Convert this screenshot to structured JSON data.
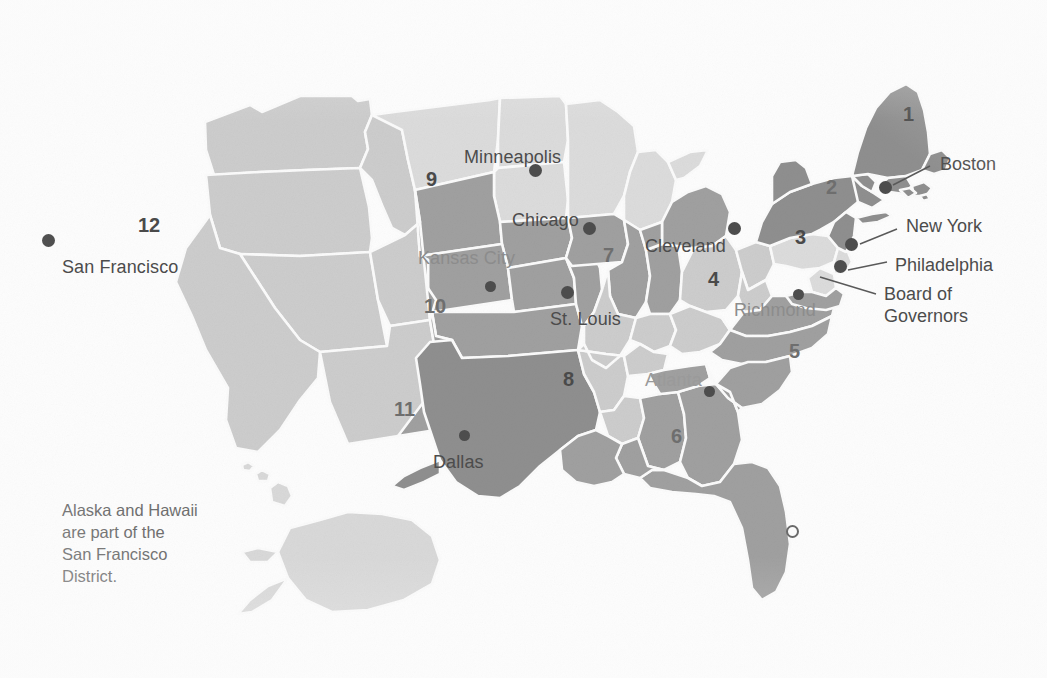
{
  "map": {
    "title_semantic": "federal-reserve-districts-map",
    "note": "Alaska and Hawaii\nare part of the\nSan Francisco\nDistrict.",
    "background_color": "#fdfdfd",
    "palette": {
      "very_light": "#dcdcdc",
      "light": "#cdcdcd",
      "mid_light": "#c4c4c4",
      "mid": "#b3b3b3",
      "mid_dark": "#a0a0a0",
      "dark": "#8f8f8f",
      "darker": "#848484",
      "outline": "#fbfbfb",
      "text": "#4c4c4c",
      "dot": "#4d4d4d"
    },
    "districts": [
      {
        "number": "1",
        "city": "Boston",
        "x": 903,
        "y": 103,
        "tone": "dark"
      },
      {
        "number": "2",
        "city": "New York",
        "x": 826,
        "y": 176,
        "tone": "dark"
      },
      {
        "number": "3",
        "city": "Philadelphia",
        "x": 799,
        "y": 233,
        "tone": "very_light"
      },
      {
        "number": "4",
        "city": "Cleveland",
        "x": 710,
        "y": 276,
        "tone": "light"
      },
      {
        "number": "5",
        "city": "Richmond",
        "x": 791,
        "y": 348,
        "tone": "mid_dark"
      },
      {
        "number": "6",
        "city": "Atlanta",
        "x": 673,
        "y": 433,
        "tone": "mid_dark"
      },
      {
        "number": "7",
        "city": "Chicago",
        "x": 606,
        "y": 252,
        "tone": "mid_dark"
      },
      {
        "number": "8",
        "city": "St. Louis",
        "x": 566,
        "y": 377,
        "tone": "light"
      },
      {
        "number": "9",
        "city": "Minneapolis",
        "x": 430,
        "y": 177,
        "tone": "very_light"
      },
      {
        "number": "10",
        "city": "Kansas City",
        "x": 432,
        "y": 304,
        "tone": "mid_dark"
      },
      {
        "number": "11",
        "city": "Dallas",
        "x": 403,
        "y": 408,
        "tone": "dark"
      },
      {
        "number": "12",
        "city": "San Francisco",
        "x": 146,
        "y": 225,
        "tone": "light"
      }
    ],
    "city_labels": [
      {
        "name": "Minneapolis",
        "x": 464,
        "y": 147,
        "style": ""
      },
      {
        "name": "Chicago",
        "x": 512,
        "y": 210,
        "style": ""
      },
      {
        "name": "Cleveland",
        "x": 645,
        "y": 236,
        "style": ""
      },
      {
        "name": "Kansas City",
        "x": 418,
        "y": 248,
        "style": "faded"
      },
      {
        "name": "St. Louis",
        "x": 550,
        "y": 309,
        "style": ""
      },
      {
        "name": "Richmond",
        "x": 734,
        "y": 300,
        "style": "faded"
      },
      {
        "name": "Atlanta",
        "x": 645,
        "y": 370,
        "style": "faded-more"
      },
      {
        "name": "Dallas",
        "x": 433,
        "y": 452,
        "style": ""
      },
      {
        "name": "San Francisco",
        "x": 62,
        "y": 257,
        "style": ""
      }
    ],
    "city_dots": [
      {
        "for": "Minneapolis",
        "x": 535,
        "y": 170
      },
      {
        "for": "Chicago",
        "x": 589,
        "y": 228
      },
      {
        "for": "Cleveland",
        "x": 734,
        "y": 228
      },
      {
        "for": "Kansas City",
        "x": 490,
        "y": 286
      },
      {
        "for": "St. Louis",
        "x": 567,
        "y": 292
      },
      {
        "for": "Richmond",
        "x": 798,
        "y": 294
      },
      {
        "for": "Atlanta",
        "x": 709,
        "y": 391
      },
      {
        "for": "Dallas",
        "x": 464,
        "y": 435
      },
      {
        "for": "San Francisco",
        "x": 48,
        "y": 240
      },
      {
        "for": "Boston",
        "x": 885,
        "y": 187
      },
      {
        "for": "New York",
        "x": 851,
        "y": 244
      },
      {
        "for": "Philadelphia",
        "x": 840,
        "y": 266
      },
      {
        "for": "Board of Governors",
        "x": 813,
        "y": 273
      }
    ],
    "callouts": [
      {
        "label": "Boston",
        "x": 940,
        "y": 154,
        "line": {
          "x1": 930,
          "y1": 166,
          "x2": 893,
          "y2": 185
        }
      },
      {
        "label": "New York",
        "x": 906,
        "y": 216,
        "line": {
          "x1": 897,
          "y1": 228,
          "x2": 860,
          "y2": 243
        }
      },
      {
        "label": "Philadelphia",
        "x": 895,
        "y": 255,
        "line": {
          "x1": 885,
          "y1": 262,
          "x2": 848,
          "y2": 269
        }
      },
      {
        "label": "Board of\nGovernors",
        "x": 884,
        "y": 285,
        "line": {
          "x1": 875,
          "y1": 294,
          "x2": 820,
          "y2": 276
        }
      }
    ]
  }
}
